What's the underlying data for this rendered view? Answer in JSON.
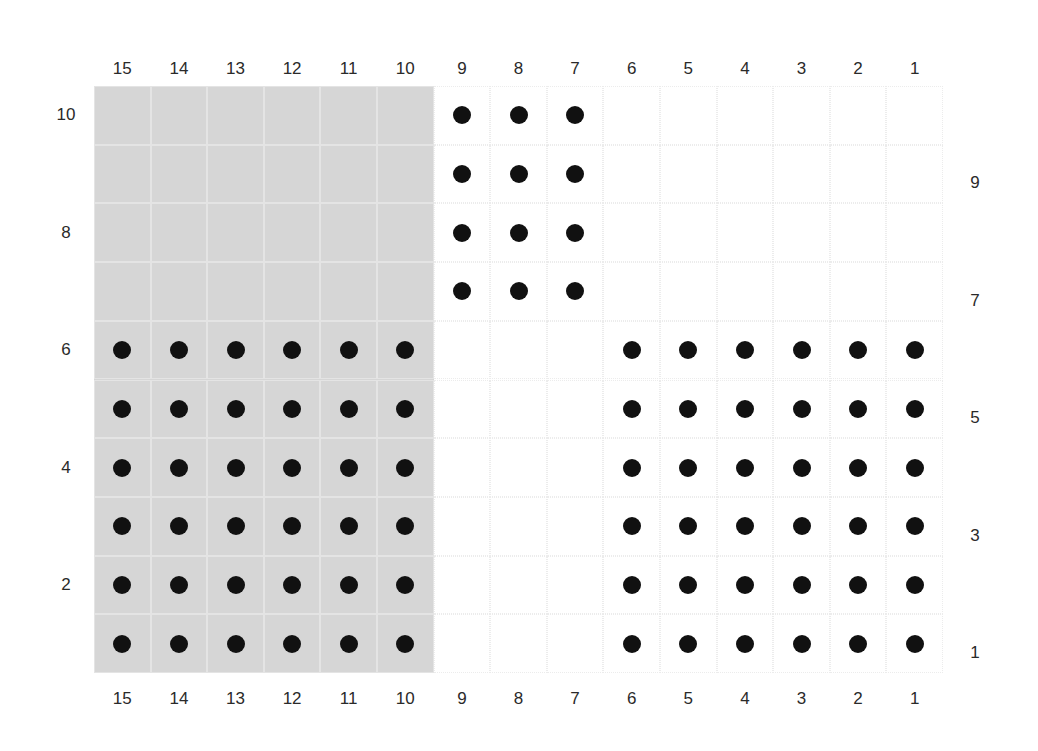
{
  "grid": {
    "columns": 15,
    "rows": 10,
    "left": 94,
    "top": 86,
    "cell_width": 56.6,
    "cell_height": 58.7,
    "shade_color": "#d6d6d6",
    "dot_color": "#111111"
  },
  "shaded_region": {
    "col_from": 15,
    "col_to": 10,
    "row_from": 10,
    "row_to": 1
  },
  "top_column_labels": [
    "15",
    "14",
    "13",
    "12",
    "11",
    "10",
    "9",
    "8",
    "7",
    "6",
    "5",
    "4",
    "3",
    "2",
    "1"
  ],
  "bottom_column_labels": [
    "15",
    "14",
    "13",
    "12",
    "11",
    "10",
    "9",
    "8",
    "7",
    "6",
    "5",
    "4",
    "3",
    "2",
    "1"
  ],
  "left_row_labels": [
    {
      "row": 10,
      "text": "10"
    },
    {
      "row": 8,
      "text": "8"
    },
    {
      "row": 6,
      "text": "6"
    },
    {
      "row": 4,
      "text": "4"
    },
    {
      "row": 2,
      "text": "2"
    }
  ],
  "right_row_labels": [
    {
      "row": 9,
      "text": "9"
    },
    {
      "row": 7,
      "text": "7"
    },
    {
      "row": 5,
      "text": "5"
    },
    {
      "row": 3,
      "text": "3"
    },
    {
      "row": 1,
      "text": "1"
    }
  ],
  "dot_blocks": [
    {
      "name": "top-middle-block",
      "cols": [
        9,
        8,
        7
      ],
      "rows": [
        10,
        9,
        8,
        7
      ]
    },
    {
      "name": "bottom-left-block",
      "cols": [
        15,
        14,
        13,
        12,
        11,
        10
      ],
      "rows": [
        6,
        5,
        4,
        3,
        2,
        1
      ]
    },
    {
      "name": "bottom-right-block",
      "cols": [
        6,
        5,
        4,
        3,
        2,
        1
      ],
      "rows": [
        6,
        5,
        4,
        3,
        2,
        1
      ]
    }
  ]
}
